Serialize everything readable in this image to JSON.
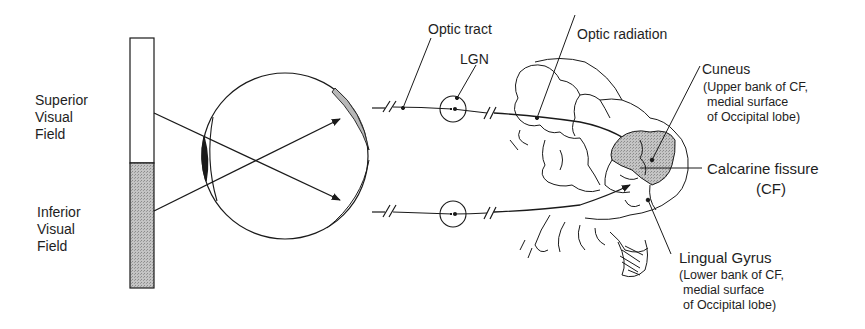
{
  "diagram": {
    "type": "anatomical-pathway",
    "colors": {
      "stroke": "#1a1a1a",
      "shaded": "#b8b8b8",
      "background": "#ffffff"
    },
    "visual_field": {
      "superior": {
        "lines": [
          "Superior",
          "Visual",
          "Field"
        ]
      },
      "inferior": {
        "lines": [
          "Inferior",
          "Visual",
          "Field"
        ]
      }
    },
    "labels": {
      "optic_tract": "Optic tract",
      "lgn": "LGN",
      "optic_radiation": "Optic radiation",
      "cuneus": {
        "title": "Cuneus",
        "lines": [
          "(Upper bank of CF,",
          "medial surface",
          "of Occipital lobe)"
        ]
      },
      "calcarine": {
        "title": "Calcarine fissure",
        "abbr": "(CF)"
      },
      "lingual": {
        "title": "Lingual Gyrus",
        "lines": [
          "(Lower bank of CF,",
          "medial surface",
          "of Occipital lobe)"
        ]
      }
    },
    "nodes": [
      "visual-field-bar",
      "eye",
      "optic-tract",
      "lgn",
      "optic-radiation",
      "occipital-cortex"
    ],
    "edges": [
      {
        "from": "superior-visual-field",
        "to": "inferior-retina",
        "via": "lens"
      },
      {
        "from": "inferior-visual-field",
        "to": "superior-retina",
        "via": "lens"
      },
      {
        "from": "superior-retina",
        "to": "cuneus",
        "via": "upper-lgn"
      },
      {
        "from": "inferior-retina",
        "to": "lingual-gyrus",
        "via": "lower-lgn"
      }
    ]
  }
}
